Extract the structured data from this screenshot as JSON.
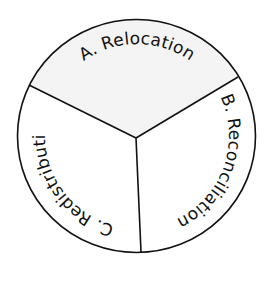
{
  "diagram": {
    "type": "segmented-circle",
    "segments": [
      {
        "id": "A",
        "label": "A. Relocation",
        "fill": "#f4f4f4",
        "start_offset": "25%"
      },
      {
        "id": "B",
        "label": "B. Reconciliation",
        "fill": "#ffffff",
        "start_offset": "55.5%"
      },
      {
        "id": "C",
        "label": "C. Redistribution",
        "fill": "#ffffff",
        "start_offset": "91.5%"
      }
    ],
    "stroke_color": "#111111",
    "text_color": "#111111"
  }
}
